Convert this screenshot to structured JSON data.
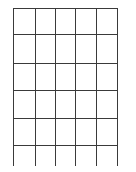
{
  "grid": {
    "columns": 5,
    "rows": 6,
    "line_color": "#3a3a3a",
    "background": "#ffffff",
    "vertical_x": [
      13,
      35,
      55,
      75,
      96,
      117
    ],
    "horizontal_y": [
      8,
      34,
      63,
      90,
      118,
      145
    ],
    "left": 13,
    "right": 117,
    "top": 8,
    "bottom": 166
  }
}
